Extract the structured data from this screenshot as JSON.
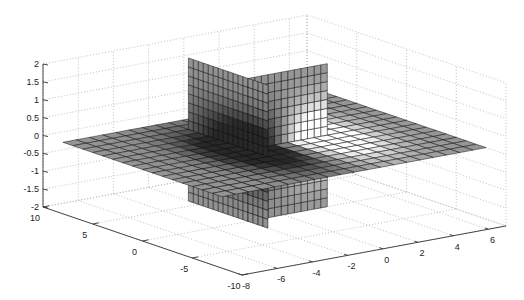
{
  "chart_data": {
    "type": "slice",
    "title": "",
    "xlabel": "",
    "ylabel": "",
    "zlabel": "",
    "xlim": [
      -8,
      7
    ],
    "ylim": [
      -10,
      10
    ],
    "zlim": [
      -2,
      2
    ],
    "x_ticks": [
      -8,
      -6,
      -4,
      -2,
      0,
      2,
      4,
      6
    ],
    "y_ticks": [
      -10,
      -5,
      0,
      5,
      10
    ],
    "z_ticks": [
      2,
      1.5,
      1,
      0.5,
      0,
      -0.5,
      -1,
      -1.5,
      -2
    ],
    "x_tick_labels": [
      "-8",
      "-6",
      "-4",
      "-2",
      "0",
      "2",
      "4",
      "6"
    ],
    "y_tick_labels": [
      "-10",
      "-5",
      "0",
      "5",
      "10"
    ],
    "z_tick_labels": [
      "2",
      "1.5",
      "1",
      "0.5",
      "0",
      "-0.5",
      "-1",
      "-1.5",
      "-2"
    ],
    "grid": true,
    "grid_style": "dotted",
    "colormap": "gray",
    "slices": [
      {
        "orientation": "x",
        "position": -2,
        "y_range": [
          -2,
          6
        ],
        "z_range": [
          -2,
          2
        ]
      },
      {
        "orientation": "y",
        "position": 0,
        "x_range": [
          -2,
          2
        ],
        "z_range": [
          -2,
          2
        ]
      },
      {
        "orientation": "z",
        "position": 0,
        "x_range": [
          -8,
          7
        ],
        "y_range": [
          -8,
          8
        ]
      }
    ],
    "view": {
      "azimuth": -37.5,
      "elevation": 30
    }
  }
}
